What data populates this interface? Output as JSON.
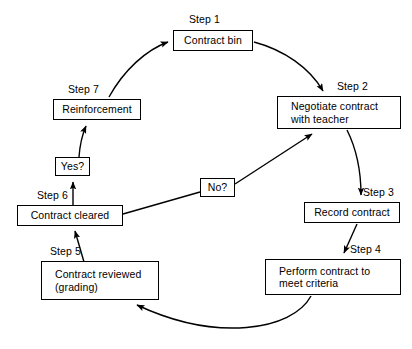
{
  "diagram": {
    "type": "cycle-flowchart",
    "background_color": "#ffffff",
    "line_color": "#000000",
    "nodes": [
      {
        "id": "contract-bin",
        "label": "Contract bin",
        "step_label": "Step 1",
        "x": 173,
        "y": 30,
        "w": 80,
        "h": 21,
        "step_x": 189,
        "step_y": 13
      },
      {
        "id": "negotiate-contract",
        "label": "Negotiate contract\nwith teacher",
        "step_label": "Step 2",
        "x": 277,
        "y": 96,
        "w": 124,
        "h": 33,
        "step_x": 337,
        "step_y": 80
      },
      {
        "id": "record-contract",
        "label": "Record contract",
        "step_label": "Step 3",
        "x": 304,
        "y": 202,
        "w": 96,
        "h": 21,
        "step_x": 363,
        "step_y": 186
      },
      {
        "id": "perform-contract",
        "label": "Perform contract to\nmeet criteria",
        "step_label": "Step 4",
        "x": 265,
        "y": 259,
        "w": 136,
        "h": 36,
        "step_x": 350,
        "step_y": 243
      },
      {
        "id": "contract-reviewed",
        "label": "Contract reviewed\n(grading)",
        "step_label": "Step 5",
        "x": 41,
        "y": 261,
        "w": 118,
        "h": 39,
        "step_x": 50,
        "step_y": 245
      },
      {
        "id": "contract-cleared",
        "label": "Contract cleared",
        "step_label": "Step 6",
        "x": 17,
        "y": 205,
        "w": 106,
        "h": 21,
        "step_x": 37,
        "step_y": 189
      },
      {
        "id": "reinforcement",
        "label": "Reinforcement",
        "step_label": "Step 7",
        "x": 53,
        "y": 99,
        "w": 88,
        "h": 21,
        "step_x": 68,
        "step_y": 83
      },
      {
        "id": "yes-decision",
        "label": "Yes?",
        "step_label": "",
        "x": 55,
        "y": 157,
        "w": 35,
        "h": 19,
        "step_x": 0,
        "step_y": 0
      },
      {
        "id": "no-decision",
        "label": "No?",
        "step_label": "",
        "x": 200,
        "y": 178,
        "w": 35,
        "h": 19,
        "step_x": 0,
        "step_y": 0
      }
    ],
    "edges": [
      {
        "id": "edge-reinforcement-to-bin",
        "from": "reinforcement",
        "to": "contract-bin",
        "style": "curve",
        "arrow": true
      },
      {
        "id": "edge-bin-to-negotiate",
        "from": "contract-bin",
        "to": "negotiate-contract",
        "style": "curve",
        "arrow": true
      },
      {
        "id": "edge-negotiate-to-record",
        "from": "negotiate-contract",
        "to": "record-contract",
        "style": "curve",
        "arrow": true
      },
      {
        "id": "edge-record-to-perform",
        "from": "record-contract",
        "to": "perform-contract",
        "style": "line",
        "arrow": true
      },
      {
        "id": "edge-perform-to-reviewed",
        "from": "perform-contract",
        "to": "contract-reviewed",
        "style": "curve",
        "arrow": true
      },
      {
        "id": "edge-reviewed-to-cleared",
        "from": "contract-reviewed",
        "to": "contract-cleared",
        "style": "line",
        "arrow": true
      },
      {
        "id": "edge-cleared-to-yes",
        "from": "contract-cleared",
        "to": "yes-decision",
        "style": "line",
        "arrow": true
      },
      {
        "id": "edge-yes-to-reinforcement",
        "from": "yes-decision",
        "to": "reinforcement",
        "style": "curve",
        "arrow": true
      },
      {
        "id": "edge-cleared-to-no",
        "from": "contract-cleared",
        "to": "no-decision",
        "style": "line",
        "arrow": false
      },
      {
        "id": "edge-no-to-negotiate",
        "from": "no-decision",
        "to": "negotiate-contract",
        "style": "line",
        "arrow": true
      }
    ]
  }
}
